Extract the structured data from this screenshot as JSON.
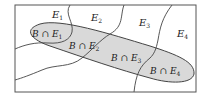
{
  "diagram": {
    "type": "venn-partition",
    "frame_color": "#555555",
    "region_fill": "#d9d9d9",
    "line_color": "#444444",
    "partitions": [
      {
        "label": "E",
        "sub": "1"
      },
      {
        "label": "E",
        "sub": "2"
      },
      {
        "label": "E",
        "sub": "3"
      },
      {
        "label": "E",
        "sub": "4"
      }
    ],
    "intersections": [
      {
        "label": "B ∩ E",
        "sub": "1"
      },
      {
        "label": "B ∩ E",
        "sub": "2"
      },
      {
        "label": "B ∩ E",
        "sub": "3"
      },
      {
        "label": "B ∩ E",
        "sub": "4"
      }
    ]
  }
}
